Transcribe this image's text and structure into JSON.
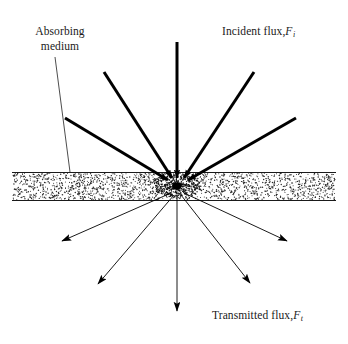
{
  "figure": {
    "width": 348,
    "height": 344,
    "background_color": "#ffffff",
    "line_color": "#000000",
    "stipple_color": "#2b2b2b"
  },
  "labels": {
    "absorbing_medium": {
      "line1": "Absorbing",
      "line2": "medium"
    },
    "incident_flux": {
      "text": "Incident flux,",
      "symbol": "F",
      "subscript": "i"
    },
    "transmitted_flux": {
      "text": "Transmitted flux,",
      "symbol": "F",
      "subscript": "t"
    }
  },
  "chart_data": {
    "type": "diagram",
    "slab": {
      "label": "Absorbing medium",
      "x_start": 12,
      "x_end": 336,
      "y_top": 172,
      "y_bottom": 201,
      "fill": "stipple",
      "dot_count": 1750
    },
    "focus_point": {
      "x": 177,
      "y": 186,
      "radius": 4.5,
      "description": "convergence-scattering point inside absorbing medium"
    },
    "incident_rays": [
      {
        "id": "incident-1",
        "x1": 65,
        "y1": 118,
        "x2": 168,
        "y2": 180,
        "width": 3.0,
        "arrowhead": true
      },
      {
        "id": "incident-2",
        "x1": 104,
        "y1": 72,
        "x2": 172,
        "y2": 178,
        "width": 3.0,
        "arrowhead": true
      },
      {
        "id": "incident-3",
        "x1": 177,
        "y1": 42,
        "x2": 177,
        "y2": 178,
        "width": 3.0,
        "arrowhead": true
      },
      {
        "id": "incident-4",
        "x1": 254,
        "y1": 72,
        "x2": 184,
        "y2": 178,
        "width": 3.0,
        "arrowhead": true
      },
      {
        "id": "incident-5",
        "x1": 296,
        "y1": 118,
        "x2": 188,
        "y2": 180,
        "width": 3.0,
        "arrowhead": true
      }
    ],
    "transmitted_rays": [
      {
        "id": "transmitted-1",
        "x1": 171,
        "y1": 193,
        "x2": 62,
        "y2": 241,
        "width": 0.9,
        "arrowhead": true
      },
      {
        "id": "transmitted-2",
        "x1": 174,
        "y1": 195,
        "x2": 98,
        "y2": 284,
        "width": 0.9,
        "arrowhead": true
      },
      {
        "id": "transmitted-3",
        "x1": 177,
        "y1": 195,
        "x2": 177,
        "y2": 311,
        "width": 0.9,
        "arrowhead": true
      },
      {
        "id": "transmitted-4",
        "x1": 181,
        "y1": 195,
        "x2": 250,
        "y2": 283,
        "width": 0.9,
        "arrowhead": true
      },
      {
        "id": "transmitted-5",
        "x1": 184,
        "y1": 193,
        "x2": 287,
        "y2": 241,
        "width": 0.9,
        "arrowhead": true
      }
    ],
    "leader_line": {
      "id": "absorbing-medium-leader",
      "x1": 55,
      "y1": 57,
      "x2": 70,
      "y2": 172,
      "width": 0.7
    },
    "axis_labels": {
      "top_right": "Incident flux, F_i",
      "bottom_right": "Transmitted flux, F_t",
      "top_left": "Absorbing medium"
    }
  }
}
